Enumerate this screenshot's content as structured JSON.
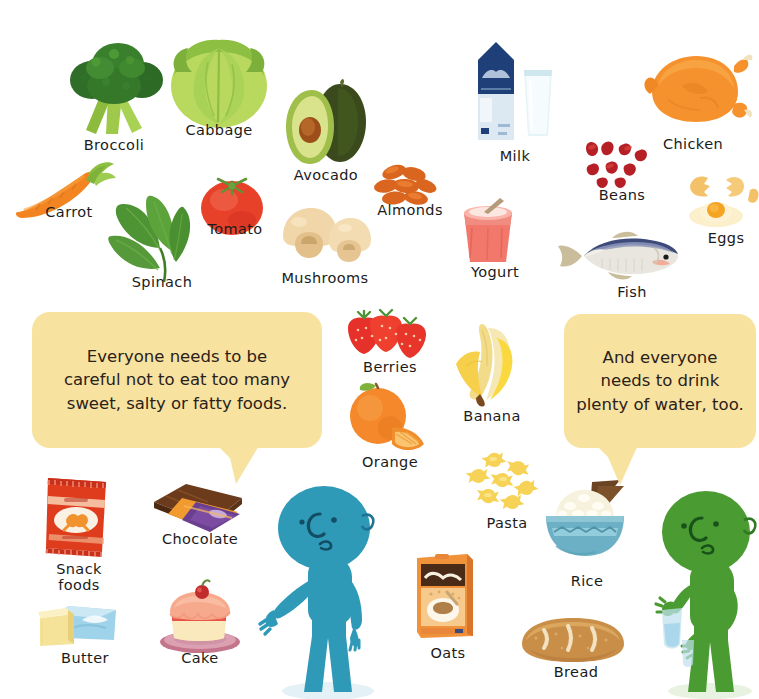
{
  "page": {
    "background_color": "#ffffff"
  },
  "palette": {
    "bubble_fill": "#f8e2a0",
    "text_color": "#1b1b1b",
    "blue_character": "#2f99b8",
    "green_character": "#4a9b32"
  },
  "foods": [
    {
      "id": "broccoli",
      "label": "Broccoli",
      "x": 56,
      "y": 38,
      "w": 118,
      "h": 100,
      "label_x": 58,
      "label_y": 137,
      "label_w": 112
    },
    {
      "id": "cabbage",
      "label": "Cabbage",
      "x": 164,
      "y": 32,
      "w": 110,
      "h": 98,
      "label_x": 163,
      "label_y": 122,
      "label_w": 112
    },
    {
      "id": "avocado",
      "label": "Avocado",
      "x": 282,
      "y": 78,
      "w": 88,
      "h": 90,
      "label_x": 272,
      "label_y": 167,
      "label_w": 108
    },
    {
      "id": "carrot",
      "label": "Carrot",
      "x": 14,
      "y": 160,
      "w": 102,
      "h": 62,
      "label_x": 20,
      "label_y": 204,
      "label_w": 98
    },
    {
      "id": "spinach",
      "label": "Spinach",
      "x": 104,
      "y": 190,
      "w": 106,
      "h": 96,
      "label_x": 108,
      "label_y": 274,
      "label_w": 108
    },
    {
      "id": "tomato",
      "label": "Tomato",
      "x": 196,
      "y": 166,
      "w": 72,
      "h": 72,
      "label_x": 186,
      "label_y": 221,
      "label_w": 98
    },
    {
      "id": "mushrooms",
      "label": "Mushrooms",
      "x": 277,
      "y": 202,
      "w": 96,
      "h": 64,
      "label_x": 264,
      "label_y": 270,
      "label_w": 122
    },
    {
      "id": "almonds",
      "label": "Almonds",
      "x": 372,
      "y": 160,
      "w": 70,
      "h": 50,
      "label_x": 362,
      "label_y": 202,
      "label_w": 96
    },
    {
      "id": "milk",
      "label": "Milk",
      "x": 468,
      "y": 36,
      "w": 90,
      "h": 110,
      "label_x": 480,
      "label_y": 148,
      "label_w": 70
    },
    {
      "id": "yogurt",
      "label": "Yogurt",
      "x": 456,
      "y": 196,
      "w": 66,
      "h": 68,
      "label_x": 452,
      "label_y": 264,
      "label_w": 86
    },
    {
      "id": "beans",
      "label": "Beans",
      "x": 580,
      "y": 138,
      "w": 72,
      "h": 50,
      "label_x": 582,
      "label_y": 187,
      "label_w": 80
    },
    {
      "id": "chicken",
      "label": "Chicken",
      "x": 638,
      "y": 48,
      "w": 112,
      "h": 84,
      "label_x": 642,
      "label_y": 136,
      "label_w": 102
    },
    {
      "id": "eggs",
      "label": "Eggs",
      "x": 686,
      "y": 168,
      "w": 74,
      "h": 62,
      "label_x": 694,
      "label_y": 230,
      "label_w": 64
    },
    {
      "id": "fish",
      "label": "Fish",
      "x": 554,
      "y": 226,
      "w": 128,
      "h": 58,
      "label_x": 600,
      "label_y": 284,
      "label_w": 64
    },
    {
      "id": "berries",
      "label": "Berries",
      "x": 344,
      "y": 310,
      "w": 88,
      "h": 52,
      "label_x": 344,
      "label_y": 359,
      "label_w": 92
    },
    {
      "id": "orange",
      "label": "Orange",
      "x": 346,
      "y": 382,
      "w": 82,
      "h": 72,
      "label_x": 344,
      "label_y": 454,
      "label_w": 92
    },
    {
      "id": "banana",
      "label": "Banana",
      "x": 452,
      "y": 322,
      "w": 72,
      "h": 86,
      "label_x": 446,
      "label_y": 408,
      "label_w": 92
    },
    {
      "id": "pasta",
      "label": "Pasta",
      "x": 466,
      "y": 452,
      "w": 78,
      "h": 62,
      "label_x": 470,
      "label_y": 515,
      "label_w": 74
    },
    {
      "id": "rice",
      "label": "Rice",
      "x": 534,
      "y": 478,
      "w": 102,
      "h": 84,
      "label_x": 556,
      "label_y": 573,
      "label_w": 62
    },
    {
      "id": "oats",
      "label": "Oats",
      "x": 411,
      "y": 548,
      "w": 70,
      "h": 92,
      "label_x": 416,
      "label_y": 645,
      "label_w": 64
    },
    {
      "id": "bread",
      "label": "Bread",
      "x": 518,
      "y": 614,
      "w": 110,
      "h": 50,
      "label_x": 538,
      "label_y": 664,
      "label_w": 76
    },
    {
      "id": "snack-foods",
      "label": "Snack\nfoods",
      "x": 40,
      "y": 472,
      "w": 74,
      "h": 86,
      "label_x": 38,
      "label_y": 562,
      "label_w": 82
    },
    {
      "id": "chocolate",
      "label": "Chocolate",
      "x": 152,
      "y": 480,
      "w": 92,
      "h": 56,
      "label_x": 146,
      "label_y": 531,
      "label_w": 108
    },
    {
      "id": "butter",
      "label": "Butter",
      "x": 38,
      "y": 600,
      "w": 84,
      "h": 50,
      "label_x": 44,
      "label_y": 650,
      "label_w": 82
    },
    {
      "id": "cake",
      "label": "Cake",
      "x": 156,
      "y": 582,
      "w": 88,
      "h": 72,
      "label_x": 164,
      "label_y": 650,
      "label_w": 72
    }
  ],
  "bubbles": [
    {
      "id": "left-bubble",
      "text": "Everyone needs to be\ncareful not to eat too many\nsweet, salty or fatty foods.",
      "x": 32,
      "y": 312,
      "w": 290,
      "h": 136,
      "font_size": 16.5,
      "tail_x": 232,
      "tail_y": 447
    },
    {
      "id": "right-bubble",
      "text": "And everyone\nneeds to drink\nplenty of water, too.",
      "x": 564,
      "y": 314,
      "w": 192,
      "h": 134,
      "font_size": 16.5,
      "tail_x": 612,
      "tail_y": 447
    }
  ],
  "characters": [
    {
      "id": "blue-character",
      "x": 258,
      "y": 486,
      "w": 132,
      "h": 213,
      "color": "#2f99b8"
    },
    {
      "id": "green-character",
      "x": 648,
      "y": 488,
      "w": 112,
      "h": 211,
      "color": "#4a9b32"
    }
  ]
}
